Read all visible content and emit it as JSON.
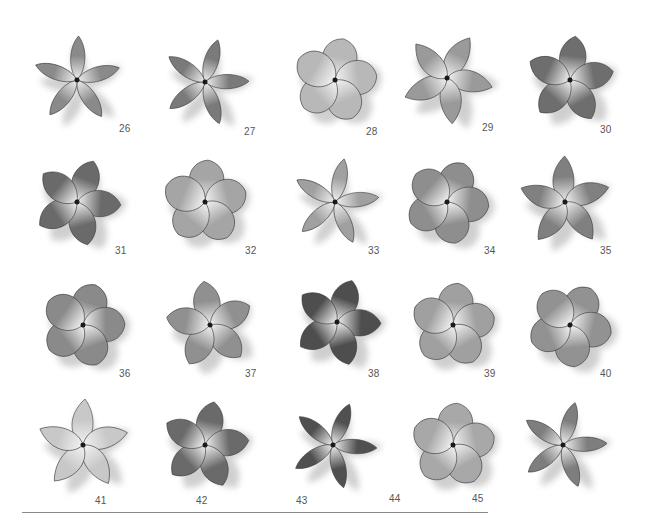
{
  "page": {
    "items": [
      {
        "number": "26",
        "style": "narrow",
        "shade": "#8a8a8a",
        "x": 22,
        "y": 28,
        "nx": 119,
        "ny": 123,
        "rot": -10
      },
      {
        "number": "27",
        "style": "narrow",
        "shade": "#7a7a7a",
        "x": 150,
        "y": 30,
        "nx": 244,
        "ny": 126,
        "rot": 5
      },
      {
        "number": "28",
        "style": "round",
        "shade": "#b8b8b8",
        "x": 280,
        "y": 28,
        "nx": 366,
        "ny": 126,
        "rot": 0
      },
      {
        "number": "29",
        "style": "pointed",
        "shade": "#9a9a9a",
        "x": 392,
        "y": 26,
        "nx": 482,
        "ny": 122,
        "rot": 15
      },
      {
        "number": "30",
        "style": "wide",
        "shade": "#6e6e6e",
        "x": 515,
        "y": 28,
        "nx": 600,
        "ny": 124,
        "rot": -5
      },
      {
        "number": "31",
        "style": "wide",
        "shade": "#6a6a6a",
        "x": 22,
        "y": 150,
        "nx": 115,
        "ny": 245,
        "rot": 10
      },
      {
        "number": "32",
        "style": "round",
        "shade": "#a5a5a5",
        "x": 150,
        "y": 150,
        "nx": 245,
        "ny": 245,
        "rot": -8
      },
      {
        "number": "33",
        "style": "narrow",
        "shade": "#a0a0a0",
        "x": 280,
        "y": 150,
        "nx": 368,
        "ny": 245,
        "rot": 0
      },
      {
        "number": "34",
        "style": "round",
        "shade": "#8e8e8e",
        "x": 392,
        "y": 150,
        "nx": 484,
        "ny": 245,
        "rot": 12
      },
      {
        "number": "35",
        "style": "pointed",
        "shade": "#808080",
        "x": 510,
        "y": 150,
        "nx": 600,
        "ny": 245,
        "rot": -15
      },
      {
        "number": "36",
        "style": "round",
        "shade": "#8a8a8a",
        "x": 28,
        "y": 273,
        "nx": 119,
        "ny": 368,
        "rot": 5
      },
      {
        "number": "37",
        "style": "wide",
        "shade": "#909090",
        "x": 155,
        "y": 273,
        "nx": 245,
        "ny": 368,
        "rot": -20
      },
      {
        "number": "38",
        "style": "wide",
        "shade": "#4e4e4e",
        "x": 282,
        "y": 270,
        "nx": 368,
        "ny": 368,
        "rot": 8
      },
      {
        "number": "39",
        "style": "round",
        "shade": "#a0a0a0",
        "x": 398,
        "y": 273,
        "nx": 484,
        "ny": 368,
        "rot": -5
      },
      {
        "number": "40",
        "style": "round",
        "shade": "#929292",
        "x": 515,
        "y": 273,
        "nx": 600,
        "ny": 368,
        "rot": 18
      },
      {
        "number": "41",
        "style": "pointed",
        "shade": "#c8c8c8",
        "x": 28,
        "y": 393,
        "nx": 95,
        "ny": 495,
        "rot": -12
      },
      {
        "number": "42",
        "style": "wide",
        "shade": "#6a6a6a",
        "x": 150,
        "y": 393,
        "nx": 196,
        "ny": 495,
        "rot": 0
      },
      {
        "number": "43",
        "style": "narrow",
        "shade": "#505050",
        "x": 278,
        "y": 393,
        "nx": 296,
        "ny": 495,
        "rot": 10
      },
      {
        "number": "44",
        "style": "round",
        "shade": "#a8a8a8",
        "x": 398,
        "y": 393,
        "nx": 389,
        "ny": 493,
        "rot": -6
      },
      {
        "number": "45",
        "style": "narrow",
        "shade": "#7e7e7e",
        "x": 508,
        "y": 393,
        "nx": 472,
        "ny": 493,
        "rot": 4
      }
    ]
  }
}
